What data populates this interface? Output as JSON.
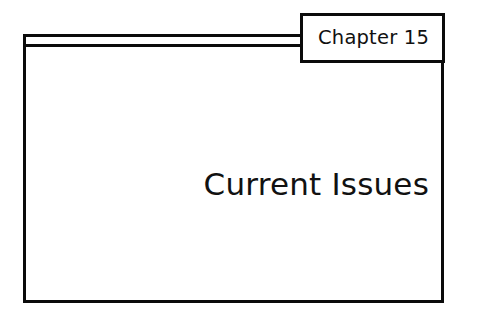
{
  "slide": {
    "kind": "chapter-divider-slide",
    "background_color": "#ffffff",
    "line_color": "#0b0b0b",
    "text_color": "#111111"
  },
  "tab": {
    "label": "Chapter 15"
  },
  "title": {
    "text": "Current Issues"
  }
}
